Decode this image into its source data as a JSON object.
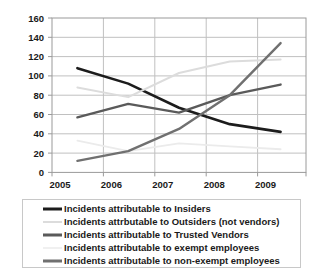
{
  "chart_data": {
    "type": "line",
    "title": "",
    "xlabel": "",
    "ylabel": "",
    "categories": [
      "2005",
      "2006",
      "2007",
      "2008",
      "2009"
    ],
    "x_tick_labels": [
      "2005",
      "2006",
      "2007",
      "2008",
      "2009"
    ],
    "y_tick_labels": [
      "0",
      "20",
      "40",
      "60",
      "80",
      "100",
      "120",
      "140",
      "160"
    ],
    "y_tick_values": [
      0,
      20,
      40,
      60,
      80,
      100,
      120,
      140,
      160
    ],
    "ylim": [
      0,
      160
    ],
    "grid": true,
    "legend_position": "bottom",
    "series": [
      {
        "name": "Incidents attributable to Insiders",
        "values": [
          108,
          92,
          67,
          50,
          42
        ],
        "color": "#1c1c1c",
        "width": 2.6
      },
      {
        "name": "Incidents attributable to Outsiders (not vendors)",
        "values": [
          88,
          78,
          103,
          115,
          117
        ],
        "color": "#dcdcdc",
        "width": 2.0
      },
      {
        "name": "Incidents attributable to Trusted Vendors",
        "values": [
          57,
          71,
          62,
          80,
          91
        ],
        "color": "#5a5a5a",
        "width": 2.4
      },
      {
        "name": "Incidents attributable to exempt employees",
        "values": [
          33,
          22,
          30,
          27,
          24
        ],
        "color": "#ebebeb",
        "width": 1.8
      },
      {
        "name": "Incidents attributable to non-exempt employees",
        "values": [
          12,
          22,
          45,
          80,
          134
        ],
        "color": "#707070",
        "width": 2.4
      }
    ]
  },
  "legend": {
    "entries": [
      {
        "label": "Incidents attributable to Insiders",
        "color": "#1c1c1c",
        "thickness": 3
      },
      {
        "label": "Incidents attrbutable to Outsiders (not vendors)",
        "color": "#dcdcdc",
        "thickness": 2
      },
      {
        "label": "Incidents attributable to Trusted Vendors",
        "color": "#5a5a5a",
        "thickness": 3
      },
      {
        "label": "Incidents attributable to exempt employees",
        "color": "#f0f0f0",
        "thickness": 2
      },
      {
        "label": "Incidents attributable to non-exempt employees",
        "color": "#707070",
        "thickness": 3
      }
    ]
  },
  "style": {
    "plot_border_color": "#9a9a9a",
    "grid_color": "#c0c0c0",
    "axis_text_color": "#1a1a1a",
    "background": "#ffffff"
  }
}
